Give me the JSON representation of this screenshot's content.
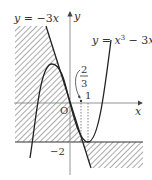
{
  "diagram": {
    "type": "function-graph",
    "curves": [
      {
        "name": "line",
        "label": "y = −3x",
        "label_parts": {
          "lhs": "y",
          "eq": " = −3",
          "var": "x"
        }
      },
      {
        "name": "cubic",
        "label": "y = x³ − 3x",
        "label_parts": {
          "lhs": "y",
          "eq": " = ",
          "var": "x",
          "sup": "3",
          "rest": " − 3",
          "var2": "x"
        }
      }
    ],
    "axes": {
      "x_label": "x",
      "y_label": "y",
      "origin_label": "O"
    },
    "tick_labels": {
      "y_neg2": "−2",
      "x_one": "1",
      "frac_num": "2",
      "frac_den": "3"
    },
    "horizontal_line": "y = −2",
    "shaded_regions": [
      "left of y=-3x and above y=-2",
      "right of y=-3x and below y=-2"
    ],
    "colors": {
      "ink": "#333333",
      "axis": "#888888",
      "hatch": "#555555"
    }
  }
}
